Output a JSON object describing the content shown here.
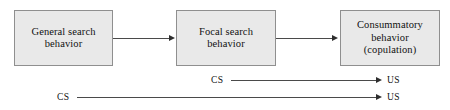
{
  "diagram": {
    "type": "flow-diagram",
    "background_color": "#ffffff",
    "box_fill_color": "#e9e9e9",
    "box_border_color": "#8f8f8f",
    "line_color": "#4a4a4a",
    "text_color": "#111111",
    "nodes": [
      {
        "id": "general-search",
        "label": "General search\nbehavior"
      },
      {
        "id": "focal-search",
        "label": "Focal search\nbehavior"
      },
      {
        "id": "consummatory",
        "label": "Consummatory\nbehavior\n(copulation)"
      }
    ],
    "node_labels": {
      "general_search": "General search behavior",
      "general_search_line1": "General search",
      "general_search_line2": "behavior",
      "focal_search": "Focal search behavior",
      "focal_search_line1": "Focal search",
      "focal_search_line2": "behavior",
      "consummatory": "Consummatory behavior (copulation)",
      "consummatory_line1": "Consummatory",
      "consummatory_line2": "behavior",
      "consummatory_line3": "(copulation)"
    },
    "conditioning_pairs": [
      {
        "id": "upper",
        "cs": "CS",
        "us": "US"
      },
      {
        "id": "lower",
        "cs": "CS",
        "us": "US"
      }
    ],
    "labels": {
      "cs_upper": "CS",
      "us_upper": "US",
      "cs_lower": "CS",
      "us_lower": "US"
    }
  }
}
